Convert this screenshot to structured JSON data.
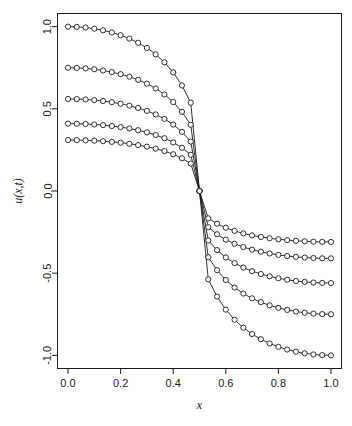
{
  "chart_data": {
    "type": "line",
    "title": "",
    "subtitle": "",
    "xlabel": "x",
    "ylabel": "u(x,t)",
    "xlim": [
      -0.04,
      1.04
    ],
    "ylim": [
      -1.08,
      1.08
    ],
    "xticks": [
      0.0,
      0.2,
      0.4,
      0.6,
      0.8,
      1.0
    ],
    "xticklabels": [
      "0.0",
      "0.2",
      "0.4",
      "0.6",
      "0.8",
      "1.0"
    ],
    "yticks": [
      -1.0,
      -0.5,
      0.0,
      0.5,
      1.0
    ],
    "yticklabels": [
      "-1.0",
      "-0.5",
      "0.0",
      "0.5",
      "1.0"
    ],
    "grid": false,
    "legend": null,
    "marker": "open-circle",
    "line_color": "#1a1a1a",
    "marker_face_color": "#ffffff",
    "marker_edge_color": "#1a1a1a",
    "n_points_per_series": 31,
    "x": [
      0.0,
      0.03333,
      0.06667,
      0.1,
      0.13333,
      0.16667,
      0.2,
      0.23333,
      0.26667,
      0.3,
      0.33333,
      0.36667,
      0.4,
      0.43333,
      0.46667,
      0.5,
      0.53333,
      0.56667,
      0.6,
      0.63333,
      0.66667,
      0.7,
      0.73333,
      0.76667,
      0.8,
      0.83333,
      0.86667,
      0.9,
      0.93333,
      0.96667,
      1.0
    ],
    "series": [
      {
        "name": "t0",
        "amplitude": 1.0,
        "values": [
          1.0,
          0.9986,
          0.9945,
          0.9876,
          0.9777,
          0.9646,
          0.948,
          0.9273,
          0.9019,
          0.8706,
          0.8318,
          0.7833,
          0.7217,
          0.6421,
          0.5373,
          0.0,
          -0.5373,
          -0.6421,
          -0.7217,
          -0.7833,
          -0.8318,
          -0.8706,
          -0.9019,
          -0.9273,
          -0.948,
          -0.9646,
          -0.9777,
          -0.9876,
          -0.9945,
          -0.9986,
          -1.0
        ]
      },
      {
        "name": "t1",
        "amplitude": 0.75,
        "values": [
          0.75,
          0.749,
          0.7459,
          0.7407,
          0.7333,
          0.7235,
          0.711,
          0.6955,
          0.6764,
          0.653,
          0.6239,
          0.5875,
          0.5413,
          0.4816,
          0.403,
          0.0,
          -0.403,
          -0.4816,
          -0.5413,
          -0.5875,
          -0.6239,
          -0.653,
          -0.6764,
          -0.6955,
          -0.711,
          -0.7235,
          -0.7333,
          -0.7407,
          -0.7459,
          -0.749,
          -0.75
        ]
      },
      {
        "name": "t2",
        "amplitude": 0.56,
        "values": [
          0.56,
          0.5592,
          0.5569,
          0.5531,
          0.5475,
          0.5402,
          0.5309,
          0.5193,
          0.5051,
          0.4875,
          0.4658,
          0.4387,
          0.4042,
          0.3596,
          0.3009,
          0.0,
          -0.3009,
          -0.3596,
          -0.4042,
          -0.4387,
          -0.4658,
          -0.4875,
          -0.5051,
          -0.5193,
          -0.5309,
          -0.5402,
          -0.5475,
          -0.5531,
          -0.5569,
          -0.5592,
          -0.56
        ]
      },
      {
        "name": "t3",
        "amplitude": 0.41,
        "values": [
          0.41,
          0.4094,
          0.4077,
          0.4049,
          0.4009,
          0.3955,
          0.3887,
          0.3802,
          0.3698,
          0.3569,
          0.341,
          0.3211,
          0.2959,
          0.2633,
          0.2203,
          0.0,
          -0.2203,
          -0.2633,
          -0.2959,
          -0.3211,
          -0.341,
          -0.3569,
          -0.3698,
          -0.3802,
          -0.3887,
          -0.3955,
          -0.4009,
          -0.4049,
          -0.4077,
          -0.4094,
          -0.41
        ]
      },
      {
        "name": "t4",
        "amplitude": 0.31,
        "values": [
          0.31,
          0.3096,
          0.3083,
          0.3062,
          0.3031,
          0.299,
          0.2939,
          0.2875,
          0.2796,
          0.2699,
          0.2579,
          0.2428,
          0.2237,
          0.1991,
          0.1666,
          0.0,
          -0.1666,
          -0.1991,
          -0.2237,
          -0.2428,
          -0.2579,
          -0.2699,
          -0.2796,
          -0.2875,
          -0.2939,
          -0.299,
          -0.3031,
          -0.3062,
          -0.3083,
          -0.3096,
          -0.31
        ]
      }
    ]
  }
}
